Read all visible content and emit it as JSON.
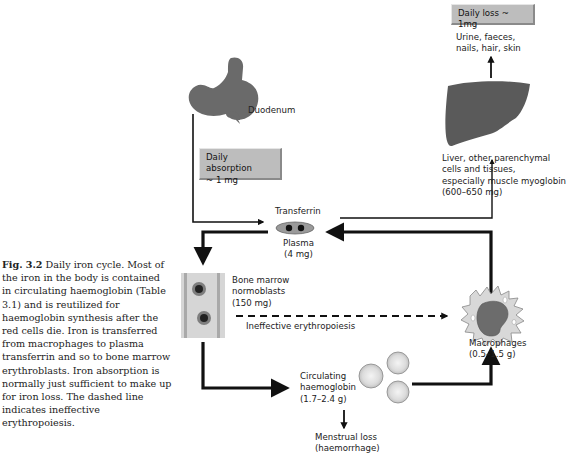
{
  "caption": {
    "fig_label": "Fig. 3.2",
    "text": "Daily iron cycle. Most of the iron in the body is contained in circulating haemoglobin (Table 3.1) and is reutilized for haemoglobin synthesis after the red cells die. Iron is transferred from macrophages to plasma transferrin and so to bone marrow erythroblasts. Iron absorption is normally just sufficient to make up for iron loss. The dashed line indicates ineffective erythropoiesis."
  },
  "diagram": {
    "duodenum": {
      "label": "Duodenum"
    },
    "absorption_box": {
      "line1": "Daily absorption",
      "line2": "~ 1 mg"
    },
    "daily_loss_box": {
      "label": "Daily loss ~ 1mg"
    },
    "loss_routes": {
      "line1": "Urine, faeces,",
      "line2": "nails, hair, skin"
    },
    "liver": {
      "line1": "Liver, other parenchymal",
      "line2": "cells and tissues,",
      "line3": "especially muscle myoglobin",
      "line4": "(600–650 mg)"
    },
    "transferrin": {
      "title": "Transferrin",
      "line1": "Plasma",
      "line2": "(4 mg)"
    },
    "bone_marrow": {
      "line1": "Bone marrow",
      "line2": "normoblasts",
      "line3": "(150 mg)"
    },
    "ineffective": {
      "label": "Ineffective erythropoiesis"
    },
    "macrophages": {
      "line1": "Macrophages",
      "line2": "(0.5–1.5 g)"
    },
    "circulating": {
      "line1": "Circulating",
      "line2": "haemoglobin",
      "line3": "(1.7–2.4 g)"
    },
    "menstrual": {
      "line1": "Menstrual loss",
      "line2": "(haemorrhage)"
    }
  }
}
